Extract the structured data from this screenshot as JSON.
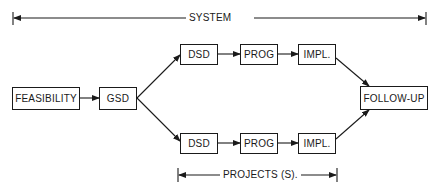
{
  "diagram": {
    "type": "flowchart",
    "spans": {
      "system": {
        "label": "SYSTEM"
      },
      "projects": {
        "label": "PROJECTS (S)."
      }
    },
    "nodes": {
      "feasibility": {
        "label": "FEASIBILITY"
      },
      "gsd": {
        "label": "GSD"
      },
      "dsd_top": {
        "label": "DSD"
      },
      "prog_top": {
        "label": "PROG"
      },
      "impl_top": {
        "label": "IMPL."
      },
      "dsd_bottom": {
        "label": "DSD"
      },
      "prog_bottom": {
        "label": "PROG"
      },
      "impl_bottom": {
        "label": "IMPL."
      },
      "follow_up": {
        "label": "FOLLOW-UP"
      }
    },
    "edges": [
      [
        "FEASIBILITY",
        "GSD"
      ],
      [
        "GSD",
        "DSD (top)"
      ],
      [
        "GSD",
        "DSD (bottom)"
      ],
      [
        "DSD (top)",
        "PROG (top)"
      ],
      [
        "PROG (top)",
        "IMPL. (top)"
      ],
      [
        "DSD (bottom)",
        "PROG (bottom)"
      ],
      [
        "PROG (bottom)",
        "IMPL. (bottom)"
      ],
      [
        "IMPL. (top)",
        "FOLLOW-UP"
      ],
      [
        "IMPL. (bottom)",
        "FOLLOW-UP"
      ]
    ]
  }
}
